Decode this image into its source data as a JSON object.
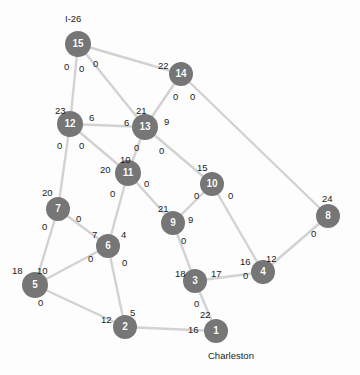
{
  "figure": {
    "type": "network-graph",
    "width": 360,
    "height": 375,
    "background": "#fdfdfd",
    "node_color": "#767676",
    "node_text_color": "#ffffff",
    "edge_color": "#d2d2d2",
    "label_color": "#1c1c1c"
  },
  "chart_data": {
    "type": "diagram",
    "title": "",
    "nodes": [
      {
        "id": "1",
        "label": "1",
        "x": 216,
        "y": 331,
        "r": 12
      },
      {
        "id": "2",
        "label": "2",
        "x": 125,
        "y": 327,
        "r": 12
      },
      {
        "id": "3",
        "label": "3",
        "x": 195,
        "y": 281,
        "r": 12
      },
      {
        "id": "4",
        "label": "4",
        "x": 263,
        "y": 272,
        "r": 12
      },
      {
        "id": "5",
        "label": "5",
        "x": 35,
        "y": 285,
        "r": 13
      },
      {
        "id": "6",
        "label": "6",
        "x": 108,
        "y": 246,
        "r": 12
      },
      {
        "id": "7",
        "label": "7",
        "x": 58,
        "y": 209,
        "r": 12
      },
      {
        "id": "8",
        "label": "8",
        "x": 328,
        "y": 216,
        "r": 12
      },
      {
        "id": "9",
        "label": "9",
        "x": 173,
        "y": 223,
        "r": 12
      },
      {
        "id": "10",
        "label": "10",
        "x": 212,
        "y": 184,
        "r": 12
      },
      {
        "id": "11",
        "label": "11",
        "x": 128,
        "y": 173,
        "r": 13
      },
      {
        "id": "12",
        "label": "12",
        "x": 70,
        "y": 124,
        "r": 13
      },
      {
        "id": "13",
        "label": "13",
        "x": 145,
        "y": 127,
        "r": 13
      },
      {
        "id": "14",
        "label": "14",
        "x": 181,
        "y": 74,
        "r": 12
      },
      {
        "id": "15",
        "label": "15",
        "x": 78,
        "y": 44,
        "r": 13
      }
    ],
    "edges": [
      {
        "from": "15",
        "to": "14"
      },
      {
        "from": "15",
        "to": "13"
      },
      {
        "from": "15",
        "to": "12"
      },
      {
        "from": "14",
        "to": "13"
      },
      {
        "from": "14",
        "to": "8"
      },
      {
        "from": "12",
        "to": "13"
      },
      {
        "from": "12",
        "to": "11"
      },
      {
        "from": "12",
        "to": "7"
      },
      {
        "from": "13",
        "to": "11"
      },
      {
        "from": "13",
        "to": "10"
      },
      {
        "from": "11",
        "to": "9"
      },
      {
        "from": "11",
        "to": "6"
      },
      {
        "from": "10",
        "to": "9"
      },
      {
        "from": "10",
        "to": "4"
      },
      {
        "from": "9",
        "to": "3"
      },
      {
        "from": "7",
        "to": "5"
      },
      {
        "from": "7",
        "to": "6"
      },
      {
        "from": "6",
        "to": "5"
      },
      {
        "from": "6",
        "to": "2"
      },
      {
        "from": "5",
        "to": "2"
      },
      {
        "from": "3",
        "to": "4"
      },
      {
        "from": "3",
        "to": "1"
      },
      {
        "from": "2",
        "to": "1"
      },
      {
        "from": "4",
        "to": "8"
      }
    ],
    "edge_labels": [
      {
        "text": "0",
        "x": 64,
        "y": 62,
        "anchor": "node-15"
      },
      {
        "text": "0",
        "x": 79,
        "y": 64,
        "anchor": "node-15"
      },
      {
        "text": "0",
        "x": 93,
        "y": 59,
        "anchor": "node-15"
      },
      {
        "text": "22",
        "x": 158,
        "y": 61,
        "anchor": "node-14"
      },
      {
        "text": "0",
        "x": 173,
        "y": 92,
        "anchor": "node-14"
      },
      {
        "text": "0",
        "x": 190,
        "y": 92,
        "anchor": "node-14"
      },
      {
        "text": "23",
        "x": 55,
        "y": 106,
        "anchor": "node-12"
      },
      {
        "text": "6",
        "x": 89,
        "y": 113,
        "anchor": "node-12"
      },
      {
        "text": "0",
        "x": 57,
        "y": 141,
        "anchor": "node-12"
      },
      {
        "text": "0",
        "x": 79,
        "y": 141,
        "anchor": "node-12"
      },
      {
        "text": "21",
        "x": 136,
        "y": 106,
        "anchor": "node-13"
      },
      {
        "text": "6",
        "x": 124,
        "y": 118,
        "anchor": "node-13"
      },
      {
        "text": "9",
        "x": 164,
        "y": 117,
        "anchor": "node-13"
      },
      {
        "text": "0",
        "x": 134,
        "y": 143,
        "anchor": "node-13"
      },
      {
        "text": "0",
        "x": 159,
        "y": 146,
        "anchor": "node-13"
      },
      {
        "text": "10",
        "x": 120,
        "y": 155,
        "anchor": "node-11"
      },
      {
        "text": "20",
        "x": 100,
        "y": 165,
        "anchor": "node-11"
      },
      {
        "text": "0",
        "x": 144,
        "y": 179,
        "anchor": "node-11"
      },
      {
        "text": "0",
        "x": 110,
        "y": 189,
        "anchor": "node-11"
      },
      {
        "text": "15",
        "x": 197,
        "y": 163,
        "anchor": "node-10"
      },
      {
        "text": "0",
        "x": 194,
        "y": 191,
        "anchor": "node-10"
      },
      {
        "text": "0",
        "x": 228,
        "y": 191,
        "anchor": "node-10"
      },
      {
        "text": "21",
        "x": 158,
        "y": 204,
        "anchor": "node-9"
      },
      {
        "text": "9",
        "x": 188,
        "y": 215,
        "anchor": "node-9"
      },
      {
        "text": "0",
        "x": 181,
        "y": 236,
        "anchor": "node-9"
      },
      {
        "text": "20",
        "x": 42,
        "y": 188,
        "anchor": "node-7"
      },
      {
        "text": "0",
        "x": 76,
        "y": 214,
        "anchor": "node-7"
      },
      {
        "text": "0",
        "x": 42,
        "y": 222,
        "anchor": "node-7"
      },
      {
        "text": "7",
        "x": 92,
        "y": 230,
        "anchor": "node-6"
      },
      {
        "text": "4",
        "x": 121,
        "y": 230,
        "anchor": "node-6"
      },
      {
        "text": "0",
        "x": 88,
        "y": 254,
        "anchor": "node-6"
      },
      {
        "text": "0",
        "x": 122,
        "y": 258,
        "anchor": "node-6"
      },
      {
        "text": "18",
        "x": 12,
        "y": 266,
        "anchor": "node-5"
      },
      {
        "text": "10",
        "x": 37,
        "y": 266,
        "anchor": "node-5"
      },
      {
        "text": "0",
        "x": 38,
        "y": 298,
        "anchor": "node-5"
      },
      {
        "text": "18",
        "x": 175,
        "y": 269,
        "anchor": "node-3"
      },
      {
        "text": "17",
        "x": 211,
        "y": 269,
        "anchor": "node-3"
      },
      {
        "text": "0",
        "x": 194,
        "y": 299,
        "anchor": "node-3"
      },
      {
        "text": "16",
        "x": 240,
        "y": 257,
        "anchor": "node-4"
      },
      {
        "text": "12",
        "x": 266,
        "y": 254,
        "anchor": "node-4"
      },
      {
        "text": "0",
        "x": 243,
        "y": 271,
        "anchor": "node-4"
      },
      {
        "text": "24",
        "x": 322,
        "y": 194,
        "anchor": "node-8"
      },
      {
        "text": "0",
        "x": 311,
        "y": 229,
        "anchor": "node-8"
      },
      {
        "text": "12",
        "x": 101,
        "y": 315,
        "anchor": "node-2"
      },
      {
        "text": "5",
        "x": 130,
        "y": 308,
        "anchor": "node-2"
      },
      {
        "text": "22",
        "x": 200,
        "y": 310,
        "anchor": "node-1"
      },
      {
        "text": "16",
        "x": 188,
        "y": 325,
        "anchor": "node-1"
      }
    ],
    "place_labels": [
      {
        "text": "I-26",
        "x": 65,
        "y": 14,
        "anchor": "node-15"
      },
      {
        "text": "Charleston",
        "x": 208,
        "y": 351,
        "anchor": "node-1"
      }
    ]
  }
}
